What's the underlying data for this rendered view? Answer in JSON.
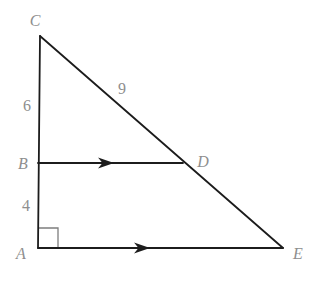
{
  "figure": {
    "width": 316,
    "height": 281,
    "background_color": "#ffffff",
    "line_color": "#1c1c1c",
    "line_width": 1.8,
    "label_color": "#8e8e8e",
    "label_font_size": 16,
    "right_angle_color": "#7d7d7d",
    "right_angle_width": 1.3,
    "points": {
      "A": {
        "x": 38,
        "y": 248
      },
      "B": {
        "x": 38,
        "y": 163
      },
      "C": {
        "x": 40,
        "y": 36
      },
      "D": {
        "x": 183,
        "y": 163
      },
      "E": {
        "x": 283,
        "y": 248
      }
    },
    "segments": [
      {
        "name": "segment-CA",
        "from": "C",
        "to": "A"
      },
      {
        "name": "segment-CE",
        "from": "C",
        "to": "E"
      },
      {
        "name": "segment-BD",
        "from": "B",
        "to": "D"
      },
      {
        "name": "segment-AE",
        "from": "A",
        "to": "E"
      }
    ],
    "parallel_arrows": [
      {
        "name": "parallel-arrow-BD",
        "tip_x": 114,
        "tip_y": 163,
        "length": 16,
        "half_width": 5.5
      },
      {
        "name": "parallel-arrow-AE",
        "tip_x": 150,
        "tip_y": 248,
        "length": 16,
        "half_width": 5.5
      }
    ],
    "right_angle": {
      "corner": "A",
      "size": 20
    },
    "labels": [
      {
        "name": "label-C",
        "text": "C",
        "x": 35,
        "y": 26,
        "italic": true
      },
      {
        "name": "label-6",
        "text": "6",
        "x": 27,
        "y": 111,
        "italic": false
      },
      {
        "name": "label-9",
        "text": "9",
        "x": 122,
        "y": 94,
        "italic": false
      },
      {
        "name": "label-B",
        "text": "B",
        "x": 23,
        "y": 169,
        "italic": true
      },
      {
        "name": "label-D",
        "text": "D",
        "x": 203,
        "y": 167,
        "italic": true
      },
      {
        "name": "label-4",
        "text": "4",
        "x": 26,
        "y": 211,
        "italic": false
      },
      {
        "name": "label-A",
        "text": "A",
        "x": 21,
        "y": 259,
        "italic": true
      },
      {
        "name": "label-E",
        "text": "E",
        "x": 298,
        "y": 259,
        "italic": true
      }
    ]
  }
}
